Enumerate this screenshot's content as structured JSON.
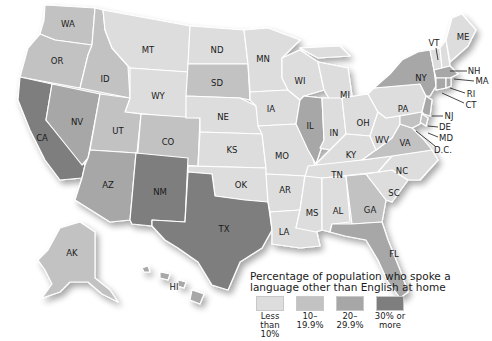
{
  "colors": {
    "c1": "#dddddd",
    "c2": "#c2c2c2",
    "c3": "#a7a7a7",
    "c4": "#7e7e7e"
  },
  "legend": {
    "title": "Percentage of population who spoke a language other than English at home",
    "items": [
      {
        "label": "Less\nthan 10%",
        "color": "#dddddd"
      },
      {
        "label": "10–\n19.9%",
        "color": "#c2c2c2"
      },
      {
        "label": "20–\n29.9%",
        "color": "#a7a7a7"
      },
      {
        "label": "30% or\nmore",
        "color": "#7e7e7e"
      }
    ]
  },
  "states": {
    "WA": {
      "label": "WA",
      "category": "10–19.9%"
    },
    "OR": {
      "label": "OR",
      "category": "10–19.9%"
    },
    "CA": {
      "label": "CA",
      "category": "30% or more"
    },
    "NV": {
      "label": "NV",
      "category": "20–29.9%"
    },
    "ID": {
      "label": "ID",
      "category": "10–19.9%"
    },
    "MT": {
      "label": "MT",
      "category": "Less than 10%"
    },
    "WY": {
      "label": "WY",
      "category": "Less than 10%"
    },
    "UT": {
      "label": "UT",
      "category": "10–19.9%"
    },
    "CO": {
      "label": "CO",
      "category": "10–19.9%"
    },
    "AZ": {
      "label": "AZ",
      "category": "20–29.9%"
    },
    "NM": {
      "label": "NM",
      "category": "30% or more"
    },
    "ND": {
      "label": "ND",
      "category": "Less than 10%"
    },
    "SD": {
      "label": "SD",
      "category": "10–19.9%"
    },
    "NE": {
      "label": "NE",
      "category": "Less than 10%"
    },
    "KS": {
      "label": "KS",
      "category": "Less than 10%"
    },
    "OK": {
      "label": "OK",
      "category": "Less than 10%"
    },
    "TX": {
      "label": "TX",
      "category": "30% or more"
    },
    "MN": {
      "label": "MN",
      "category": "Less than 10%"
    },
    "IA": {
      "label": "IA",
      "category": "Less than 10%"
    },
    "MO": {
      "label": "MO",
      "category": "Less than 10%"
    },
    "AR": {
      "label": "AR",
      "category": "Less than 10%"
    },
    "LA": {
      "label": "LA",
      "category": "Less than 10%"
    },
    "WI": {
      "label": "WI",
      "category": "Less than 10%"
    },
    "IL": {
      "label": "IL",
      "category": "20–29.9%"
    },
    "MI": {
      "label": "MI",
      "category": "Less than 10%"
    },
    "IN": {
      "label": "IN",
      "category": "Less than 10%"
    },
    "OH": {
      "label": "OH",
      "category": "Less than 10%"
    },
    "KY": {
      "label": "KY",
      "category": "Less than 10%"
    },
    "TN": {
      "label": "TN",
      "category": "Less than 10%"
    },
    "MS": {
      "label": "MS",
      "category": "Less than 10%"
    },
    "AL": {
      "label": "AL",
      "category": "Less than 10%"
    },
    "GA": {
      "label": "GA",
      "category": "10–19.9%"
    },
    "FL": {
      "label": "FL",
      "category": "20–29.9%"
    },
    "SC": {
      "label": "SC",
      "category": "Less than 10%"
    },
    "NC": {
      "label": "NC",
      "category": "Less than 10%"
    },
    "VA": {
      "label": "VA",
      "category": "10–19.9%"
    },
    "WV": {
      "label": "WV",
      "category": "Less than 10%"
    },
    "PA": {
      "label": "PA",
      "category": "Less than 10%"
    },
    "NY": {
      "label": "NY",
      "category": "20–29.9%"
    },
    "VT": {
      "label": "VT",
      "category": "Less than 10%"
    },
    "NH": {
      "label": "NH",
      "category": "Less than 10%"
    },
    "ME": {
      "label": "ME",
      "category": "Less than 10%"
    },
    "MA": {
      "label": "MA",
      "category": "20–29.9%"
    },
    "RI": {
      "label": "RI",
      "category": "20–29.9%"
    },
    "CT": {
      "label": "CT",
      "category": "20–29.9%"
    },
    "NJ": {
      "label": "NJ",
      "category": "20–29.9%"
    },
    "DE": {
      "label": "DE",
      "category": "10–19.9%"
    },
    "MD": {
      "label": "MD",
      "category": "10–19.9%"
    },
    "DC": {
      "label": "D.C.",
      "category": "10–19.9%"
    },
    "AK": {
      "label": "AK",
      "category": "10–19.9%"
    },
    "HI": {
      "label": "HI",
      "category": "20–29.9%"
    }
  }
}
